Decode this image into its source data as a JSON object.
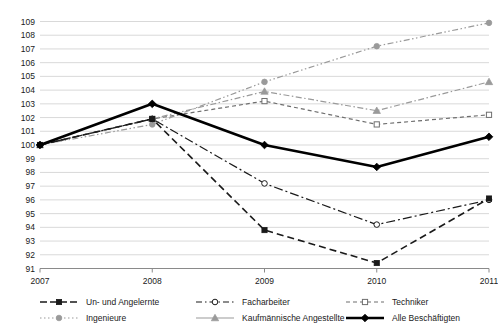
{
  "chart_data": {
    "type": "line",
    "title": "",
    "subtitle": "",
    "xlabel": "",
    "ylabel": "",
    "x": [
      2007,
      2008,
      2009,
      2010,
      2011
    ],
    "categories": [
      "2007",
      "2008",
      "2009",
      "2010",
      "2011"
    ],
    "xlim": [
      2007,
      2011
    ],
    "ylim": [
      91,
      109
    ],
    "yticks": [
      91,
      92,
      93,
      94,
      95,
      96,
      97,
      98,
      99,
      100,
      101,
      102,
      103,
      104,
      105,
      106,
      107,
      108,
      109
    ],
    "ytick_labels": [
      "91",
      "92",
      "93",
      "94",
      "95",
      "96",
      "97",
      "98",
      "99",
      "100",
      "101",
      "102",
      "103",
      "104",
      "105",
      "106",
      "107",
      "108",
      "109"
    ],
    "xtick_labels": [
      "2007",
      "2008",
      "2009",
      "2010",
      "2011"
    ],
    "grid": true,
    "grid_axis": "y",
    "legend_position": "bottom",
    "series": [
      {
        "name": "Un- und Angelernte",
        "values": [
          100.0,
          101.9,
          93.8,
          91.4,
          96.1
        ],
        "color": "#1a1a1a",
        "dash": "7,4",
        "width": 1.6,
        "marker": "square-filled",
        "legend_dash": "7,3"
      },
      {
        "name": "Facharbeiter",
        "values": [
          100.0,
          101.9,
          97.2,
          94.2,
          96.0
        ],
        "color": "#1a1a1a",
        "dash": "9,3,2,3",
        "width": 1.2,
        "marker": "circle-open",
        "legend_dash": "6,3,1.5,3"
      },
      {
        "name": "Techniker",
        "values": [
          100.0,
          101.9,
          103.2,
          101.5,
          102.2
        ],
        "color": "#6e6e6e",
        "dash": "4,3",
        "width": 1.2,
        "marker": "square-open",
        "legend_dash": "4,3"
      },
      {
        "name": "Ingenieure",
        "values": [
          100.0,
          101.5,
          104.6,
          107.2,
          108.9
        ],
        "color": "#9a9a9a",
        "dash": "6,2.5,1.5,2.5,1.5,2.5",
        "width": 1.2,
        "marker": "circle-filled",
        "legend_dash": "1.5,2.5"
      },
      {
        "name": "Kaufmännische Angestellte",
        "values": [
          100.0,
          101.9,
          103.9,
          102.5,
          104.6
        ],
        "color": "#9a9a9a",
        "dash": "6,2.5,1.5,2.5",
        "width": 1.2,
        "marker": "triangle-filled",
        "legend_dash": "0"
      },
      {
        "name": "Alle Beschäftigten",
        "values": [
          100.0,
          103.0,
          100.0,
          98.4,
          100.6
        ],
        "color": "#000000",
        "dash": "0",
        "width": 2.6,
        "marker": "diamond-filled",
        "legend_dash": "0"
      }
    ]
  },
  "legend": {
    "entries": [
      {
        "label": "Un- und Angelernte"
      },
      {
        "label": "Facharbeiter"
      },
      {
        "label": "Techniker"
      },
      {
        "label": "Ingenieure"
      },
      {
        "label": "Kaufmännische Angestellte"
      },
      {
        "label": "Alle Beschäftigten"
      }
    ]
  }
}
